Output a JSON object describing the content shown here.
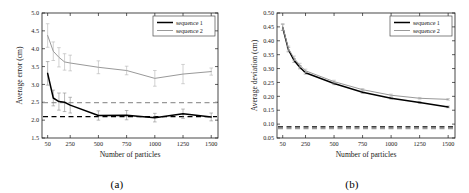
{
  "figure": {
    "caption_a": "(a)",
    "caption_b": "(b)",
    "series_color_1": "#000000",
    "series_color_2": "#999999"
  },
  "chart_data": [
    {
      "type": "line",
      "panel": "a",
      "title": "",
      "xlabel": "Number of particles",
      "ylabel": "Average error (cm)",
      "xlim": [
        0,
        1560
      ],
      "ylim": [
        1.5,
        5.0
      ],
      "xticks": [
        50,
        250,
        500,
        750,
        1000,
        1250,
        1500
      ],
      "xticklabels": [
        "50",
        "250",
        "500",
        "750",
        "1000",
        "1250",
        "1500"
      ],
      "yticks": [
        1.5,
        2.0,
        2.5,
        3.0,
        3.5,
        4.0,
        4.5,
        5.0
      ],
      "yticklabels": [
        "1.5",
        "2.0",
        "2.5",
        "3.0",
        "3.5",
        "4.0",
        "4.5",
        "5.0"
      ],
      "grid": false,
      "legend_position": "upper right",
      "series": [
        {
          "name": "sequence 1",
          "color": "#000000",
          "x": [
            50,
            100,
            150,
            200,
            250,
            500,
            750,
            1000,
            1250,
            1500
          ],
          "values": [
            3.31,
            2.62,
            2.52,
            2.5,
            2.42,
            2.13,
            2.14,
            2.07,
            2.18,
            2.09
          ],
          "yerr": [
            0.33,
            0.22,
            0.24,
            0.26,
            0.22,
            0.13,
            0.13,
            0.12,
            0.13,
            0.11
          ]
        },
        {
          "name": "sequence 2",
          "color": "#999999",
          "x": [
            50,
            100,
            150,
            200,
            250,
            500,
            750,
            1000,
            1250,
            1500
          ],
          "values": [
            4.37,
            3.93,
            3.76,
            3.63,
            3.6,
            3.48,
            3.39,
            3.17,
            3.29,
            3.36
          ],
          "yerr": [
            0.33,
            0.26,
            0.27,
            0.23,
            0.22,
            0.18,
            0.12,
            0.22,
            0.27,
            0.1
          ]
        }
      ],
      "reference_lines": [
        {
          "name": "sequence 1 baseline",
          "y": 2.1,
          "color": "#000000",
          "style": "dashed"
        },
        {
          "name": "sequence 2 baseline",
          "y": 2.49,
          "color": "#999999",
          "style": "dashed"
        }
      ]
    },
    {
      "type": "line",
      "panel": "b",
      "title": "",
      "xlabel": "Number of particles",
      "ylabel": "Average deviation (cm)",
      "xlim": [
        0,
        1560
      ],
      "ylim": [
        0.05,
        0.5
      ],
      "xticks": [
        50,
        250,
        500,
        750,
        1000,
        1250,
        1500
      ],
      "xticklabels": [
        "50",
        "250",
        "500",
        "750",
        "1000",
        "1250",
        "1500"
      ],
      "yticks": [
        0.05,
        0.1,
        0.15,
        0.2,
        0.25,
        0.3,
        0.35,
        0.4,
        0.45,
        0.5
      ],
      "yticklabels": [
        "0.05",
        "0.10",
        "0.15",
        "0.20",
        "0.25",
        "0.30",
        "0.35",
        "0.40",
        "0.45",
        "0.50"
      ],
      "grid": false,
      "legend_position": "upper right",
      "series": [
        {
          "name": "sequence 1",
          "color": "#000000",
          "x": [
            50,
            100,
            150,
            200,
            250,
            500,
            750,
            1000,
            1250,
            1500
          ],
          "values": [
            0.448,
            0.368,
            0.329,
            0.305,
            0.285,
            0.246,
            0.215,
            0.193,
            0.178,
            0.162
          ],
          "yerr": [
            0.011,
            0.008,
            0.007,
            0.006,
            0.005,
            0.004,
            0.004,
            0.003,
            0.003,
            0.003
          ]
        },
        {
          "name": "sequence 2",
          "color": "#999999",
          "x": [
            50,
            100,
            150,
            200,
            250,
            500,
            750,
            1000,
            1250,
            1500
          ],
          "values": [
            0.45,
            0.372,
            0.337,
            0.312,
            0.292,
            0.253,
            0.224,
            0.204,
            0.193,
            0.189
          ],
          "yerr": [
            0.012,
            0.009,
            0.008,
            0.007,
            0.006,
            0.005,
            0.004,
            0.004,
            0.003,
            0.003
          ]
        }
      ],
      "reference_lines": [
        {
          "name": "sequence 1 baseline",
          "y": 0.09,
          "color": "#000000",
          "style": "dashed"
        },
        {
          "name": "sequence 2 baseline",
          "y": 0.084,
          "color": "#999999",
          "style": "dashed"
        }
      ]
    }
  ]
}
